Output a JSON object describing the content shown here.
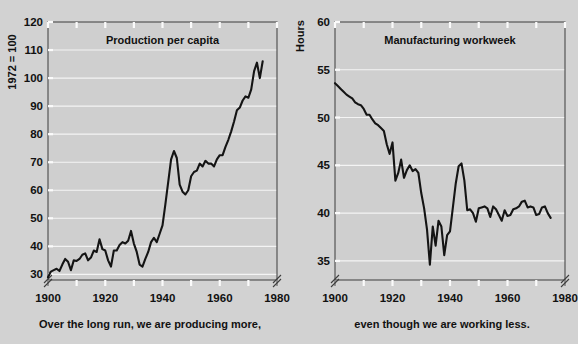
{
  "figure": {
    "background_color": "#d2d2d2",
    "line_color": "#141414",
    "grid_color": "#f4f4f4"
  },
  "captions": {
    "left": "Over the long run, we are producing more,",
    "right": "even though we are working less."
  },
  "chart_data": [
    {
      "type": "line",
      "title": "Production per capita",
      "ylabel": "1972 = 100",
      "xlabel": "",
      "xlim": [
        1900,
        1980
      ],
      "ylim": [
        28,
        120
      ],
      "ytick_labels": [
        "30",
        "40",
        "50",
        "60",
        "70",
        "80",
        "90",
        "100",
        "110",
        "120"
      ],
      "yticks": [
        30,
        40,
        50,
        60,
        70,
        80,
        90,
        100,
        110,
        120
      ],
      "xtick_labels": [
        "1900",
        "1920",
        "1940",
        "1960",
        "1980"
      ],
      "xticks_labeled": [
        1900,
        1920,
        1940,
        1960,
        1980
      ],
      "xticks_minor": [
        1910,
        1930,
        1950,
        1970
      ],
      "grid": true,
      "grid_values": [
        30,
        40,
        50,
        60,
        70,
        80,
        90,
        100,
        110
      ],
      "axis_break": true,
      "x": [
        1900,
        1901,
        1902,
        1903,
        1904,
        1905,
        1906,
        1907,
        1908,
        1909,
        1910,
        1911,
        1912,
        1913,
        1914,
        1915,
        1916,
        1917,
        1918,
        1919,
        1920,
        1921,
        1922,
        1923,
        1924,
        1925,
        1926,
        1927,
        1928,
        1929,
        1930,
        1931,
        1932,
        1933,
        1934,
        1935,
        1936,
        1937,
        1938,
        1939,
        1940,
        1941,
        1942,
        1943,
        1944,
        1945,
        1946,
        1947,
        1948,
        1949,
        1950,
        1951,
        1952,
        1953,
        1954,
        1955,
        1956,
        1957,
        1958,
        1959,
        1960,
        1961,
        1962,
        1963,
        1964,
        1965,
        1966,
        1967,
        1968,
        1969,
        1970,
        1971,
        1972,
        1973,
        1974,
        1975
      ],
      "values": [
        29.0,
        31.0,
        31.5,
        32.0,
        31.2,
        33.5,
        35.5,
        34.5,
        31.5,
        35.0,
        34.8,
        35.5,
        37.0,
        37.5,
        35.0,
        36.0,
        38.5,
        38.0,
        42.5,
        39.0,
        38.5,
        35.0,
        32.8,
        38.5,
        38.5,
        40.5,
        41.5,
        41.0,
        42.0,
        45.5,
        41.0,
        38.0,
        33.5,
        32.8,
        35.5,
        38.0,
        41.5,
        43.0,
        41.5,
        44.5,
        47.5,
        55.0,
        63.0,
        71.0,
        74.0,
        71.5,
        62.0,
        59.5,
        58.5,
        60.0,
        65.0,
        66.5,
        67.0,
        69.5,
        68.5,
        70.5,
        69.5,
        69.5,
        68.5,
        71.0,
        72.5,
        72.5,
        75.5,
        78.0,
        81.0,
        84.5,
        88.5,
        89.5,
        92.0,
        93.5,
        93.0,
        96.0,
        102.5,
        105.5,
        100.0,
        106.0
      ]
    },
    {
      "type": "line",
      "title": "Manufacturing workweek",
      "ylabel": "Hours",
      "xlabel": "",
      "xlim": [
        1900,
        1980
      ],
      "ylim": [
        33,
        60
      ],
      "ytick_labels": [
        "35",
        "40",
        "45",
        "50",
        "55",
        "60"
      ],
      "yticks": [
        35,
        40,
        45,
        50,
        55,
        60
      ],
      "xtick_labels": [
        "1900",
        "1920",
        "1940",
        "1960",
        "1980"
      ],
      "xticks_labeled": [
        1900,
        1920,
        1940,
        1960,
        1980
      ],
      "xticks_minor": [
        1910,
        1930,
        1950,
        1970
      ],
      "grid": true,
      "grid_values": [
        35,
        40,
        45,
        50,
        55
      ],
      "axis_break": true,
      "x": [
        1900,
        1901,
        1902,
        1903,
        1904,
        1905,
        1906,
        1907,
        1908,
        1909,
        1910,
        1911,
        1912,
        1913,
        1914,
        1915,
        1916,
        1917,
        1918,
        1919,
        1920,
        1921,
        1922,
        1923,
        1924,
        1925,
        1926,
        1927,
        1928,
        1929,
        1930,
        1931,
        1932,
        1933,
        1934,
        1935,
        1936,
        1937,
        1938,
        1939,
        1940,
        1941,
        1942,
        1943,
        1944,
        1945,
        1946,
        1947,
        1948,
        1949,
        1950,
        1951,
        1952,
        1953,
        1954,
        1955,
        1956,
        1957,
        1958,
        1959,
        1960,
        1961,
        1962,
        1963,
        1964,
        1965,
        1966,
        1967,
        1968,
        1969,
        1970,
        1971,
        1972,
        1973,
        1974,
        1975
      ],
      "values": [
        53.6,
        53.3,
        53.0,
        52.7,
        52.4,
        52.2,
        52.0,
        51.6,
        51.4,
        51.3,
        50.9,
        50.3,
        50.3,
        49.8,
        49.4,
        49.2,
        48.9,
        48.6,
        47.2,
        46.2,
        47.4,
        43.4,
        44.2,
        45.6,
        43.7,
        44.5,
        45.0,
        44.4,
        44.6,
        44.2,
        42.1,
        40.5,
        38.3,
        34.6,
        38.6,
        36.6,
        39.2,
        38.6,
        35.6,
        37.7,
        38.1,
        40.6,
        43.1,
        44.9,
        45.2,
        43.4,
        40.3,
        40.4,
        40.0,
        39.1,
        40.5,
        40.6,
        40.7,
        40.5,
        39.6,
        40.7,
        40.4,
        39.8,
        39.2,
        40.3,
        39.7,
        39.8,
        40.4,
        40.5,
        40.7,
        41.2,
        41.3,
        40.6,
        40.7,
        40.6,
        39.8,
        39.9,
        40.6,
        40.7,
        40.0,
        39.5
      ]
    }
  ]
}
